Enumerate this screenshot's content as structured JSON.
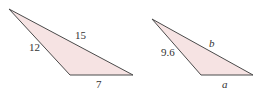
{
  "diagram": {
    "colors": {
      "fill": "#f6e3e3",
      "stroke": "#4a4a4a",
      "text": "#333333"
    },
    "triangles": [
      {
        "id": "triangle-1",
        "vertices": {
          "apex": [
            9,
            9
          ],
          "bottom_left": [
            70,
            75
          ],
          "bottom_right": [
            133,
            75
          ]
        },
        "sides": [
          {
            "side": "left",
            "label": "12",
            "italic": false
          },
          {
            "side": "top",
            "label": "15",
            "italic": false
          },
          {
            "side": "bottom",
            "label": "7",
            "italic": false
          }
        ]
      },
      {
        "id": "triangle-2",
        "vertices": {
          "apex": [
            152,
            19
          ],
          "bottom_left": [
            201,
            75
          ],
          "bottom_right": [
            253,
            75
          ]
        },
        "sides": [
          {
            "side": "left",
            "label": "9.6",
            "italic": false
          },
          {
            "side": "top",
            "label": "b",
            "italic": true
          },
          {
            "side": "bottom",
            "label": "a",
            "italic": true
          }
        ]
      }
    ]
  }
}
